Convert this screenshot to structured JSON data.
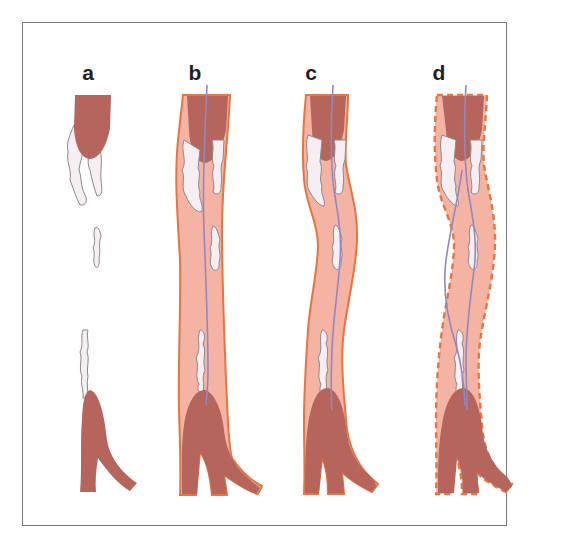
{
  "figure": {
    "panels": [
      {
        "id": "a",
        "label": "a",
        "description": "occluded vessel: thrombus proximal and distal, plaque fragments, no vessel wall shown"
      },
      {
        "id": "b",
        "label": "b",
        "description": "vessel with solid wall, guidewire passing through lumen"
      },
      {
        "id": "c",
        "label": "c",
        "description": "tortuous vessel with solid wall, guidewire through lumen"
      },
      {
        "id": "d",
        "label": "d",
        "description": "tortuous vessel with dashed wall, guidewire taking subintimal path"
      }
    ]
  },
  "colors": {
    "thrombus": "#b5655b",
    "lumen": "#f4b3a3",
    "wall": "#e8743f",
    "plaque_fill": "#f6eef2",
    "plaque_stroke": "#8a8a8a",
    "guidewire": "#9088c0",
    "frame": "#7a7a7a",
    "label": "#1f1f1f"
  }
}
